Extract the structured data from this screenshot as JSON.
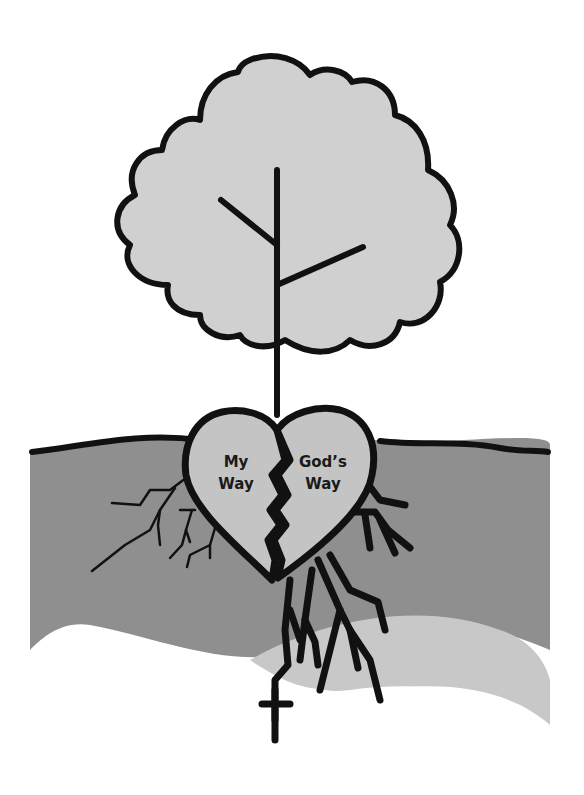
{
  "illustration": {
    "subject": "Tree rooted in a broken heart with a cross below",
    "heart_left_label_line1": "My",
    "heart_left_label_line2": "Way",
    "heart_right_label_line1": "God’s",
    "heart_right_label_line2": "Way"
  },
  "colors": {
    "outline": "#111111",
    "canopy_fill": "#d0d0d0",
    "heart_fill": "#c4c4c4",
    "soil_fill": "#8f8f8f",
    "lower_band_fill": "#c8c8c8",
    "background": "#ffffff"
  }
}
